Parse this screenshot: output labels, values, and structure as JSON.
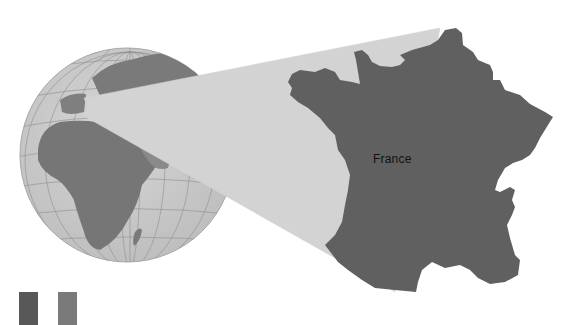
{
  "map": {
    "highlight_label": "France",
    "colors": {
      "background": "#ffffff",
      "ocean": "#c9c9c9",
      "globe_land": "#7a7a7a",
      "globe_land_light": "#9a9a9a",
      "graticule": "#8c8c8c",
      "zoom_wedge": "#d3d3d3",
      "highlight_country": "#606060",
      "label": "#111111"
    }
  },
  "flag": {
    "stripes": [
      "#585858",
      "#ffffff",
      "#7a7a7a"
    ]
  }
}
